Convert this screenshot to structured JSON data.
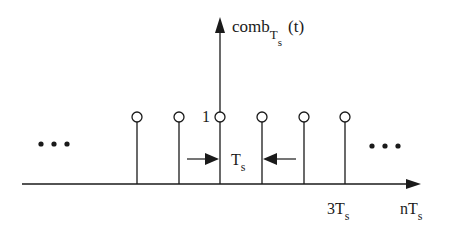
{
  "diagram": {
    "y_axis_label": {
      "main": "comb",
      "subscript_main": "T",
      "subscript_sub": "s",
      "arg": "(t)"
    },
    "x_axis_label": {
      "main": "nT",
      "subscript": "s"
    },
    "height_label": "1",
    "spacing_label": {
      "main": "T",
      "subscript": "s"
    },
    "tick_label": {
      "main": "3T",
      "subscript": "s"
    },
    "ellipsis_left": "•••",
    "ellipsis_right": "•••",
    "impulse_positions_px": [
      137,
      179,
      220,
      262,
      304,
      345
    ],
    "colors": {
      "stroke": "#1a1a1a",
      "background": "#ffffff"
    }
  }
}
